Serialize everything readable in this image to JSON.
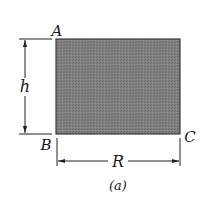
{
  "figure": {
    "caption": "(a)",
    "shape": "rectangle",
    "fill_color": "#7a7a7a",
    "edge_color": "#3a3a3a",
    "corners": {
      "top_left": "A",
      "bottom_left": "B",
      "bottom_right": "C"
    },
    "dimensions": {
      "height": "h",
      "width": "R"
    }
  }
}
